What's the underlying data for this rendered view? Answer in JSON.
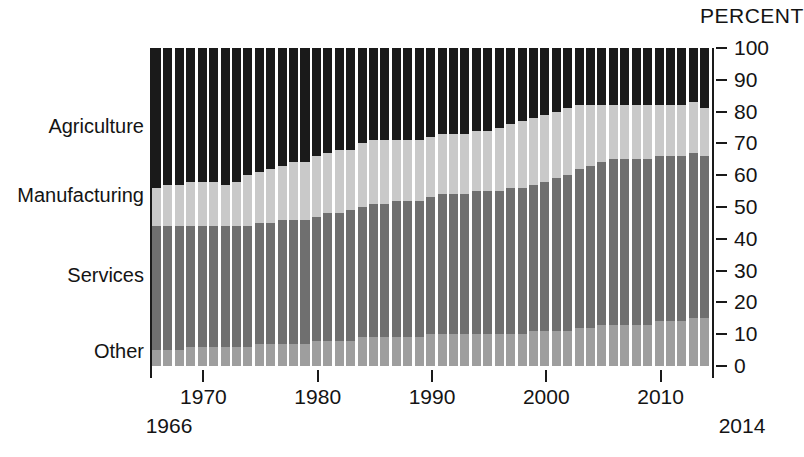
{
  "chart_data": {
    "type": "bar",
    "subtype": "stacked-100-percent",
    "title": "",
    "axis_header": "PERCENT",
    "xlabel": "",
    "ylabel": "PERCENT",
    "ylim": [
      0,
      100
    ],
    "yticks": [
      0,
      10,
      20,
      30,
      40,
      50,
      60,
      70,
      80,
      90,
      100
    ],
    "grid": false,
    "legend_position": "left-inline-labels",
    "x_axis_endpoints": [
      "1966",
      "2014"
    ],
    "xticks": [
      1970,
      1980,
      1990,
      2000,
      2010
    ],
    "xtick_labels": [
      "1970",
      "1980",
      "1990",
      "2000",
      "2010"
    ],
    "categories": [
      1966,
      1967,
      1968,
      1969,
      1970,
      1971,
      1972,
      1973,
      1974,
      1975,
      1976,
      1977,
      1978,
      1979,
      1980,
      1981,
      1982,
      1983,
      1984,
      1985,
      1986,
      1987,
      1988,
      1989,
      1990,
      1991,
      1992,
      1993,
      1994,
      1995,
      1996,
      1997,
      1998,
      1999,
      2000,
      2001,
      2002,
      2003,
      2004,
      2005,
      2006,
      2007,
      2008,
      2009,
      2010,
      2011,
      2012,
      2013,
      2014
    ],
    "series": [
      {
        "name": "Other",
        "color": "#9e9e9e",
        "order": 0,
        "values": [
          5,
          5,
          5,
          6,
          6,
          6,
          6,
          6,
          6,
          7,
          7,
          7,
          7,
          7,
          8,
          8,
          8,
          8,
          9,
          9,
          9,
          9,
          9,
          9,
          10,
          10,
          10,
          10,
          10,
          10,
          10,
          10,
          10,
          11,
          11,
          11,
          11,
          12,
          12,
          13,
          13,
          13,
          13,
          13,
          14,
          14,
          14,
          15,
          15
        ]
      },
      {
        "name": "Services",
        "color": "#6f6f6f",
        "order": 1,
        "values": [
          39,
          39,
          39,
          38,
          38,
          38,
          38,
          38,
          38,
          38,
          38,
          39,
          39,
          39,
          39,
          40,
          40,
          41,
          41,
          42,
          42,
          43,
          43,
          43,
          43,
          44,
          44,
          44,
          45,
          45,
          45,
          46,
          46,
          46,
          47,
          48,
          49,
          50,
          51,
          51,
          52,
          52,
          52,
          52,
          52,
          52,
          52,
          52,
          51
        ]
      },
      {
        "name": "Manufacturing",
        "color": "#c9c9c9",
        "order": 2,
        "values": [
          12,
          13,
          13,
          14,
          14,
          14,
          13,
          14,
          16,
          16,
          17,
          17,
          18,
          18,
          19,
          19,
          20,
          19,
          20,
          20,
          20,
          19,
          19,
          19,
          19,
          19,
          19,
          19,
          19,
          19,
          20,
          20,
          21,
          21,
          21,
          21,
          21,
          20,
          19,
          18,
          17,
          17,
          17,
          17,
          16,
          16,
          16,
          16,
          15
        ]
      },
      {
        "name": "Agriculture",
        "color": "#1a1a1a",
        "order": 3,
        "values": [
          44,
          43,
          43,
          42,
          42,
          42,
          43,
          42,
          40,
          39,
          38,
          37,
          36,
          36,
          34,
          33,
          32,
          32,
          30,
          29,
          29,
          29,
          29,
          29,
          28,
          27,
          27,
          27,
          26,
          26,
          25,
          24,
          23,
          22,
          21,
          20,
          19,
          18,
          18,
          18,
          18,
          18,
          18,
          18,
          18,
          18,
          18,
          17,
          19
        ]
      }
    ],
    "category_labels": [
      {
        "name": "Agriculture",
        "color": "#1a1a1a",
        "y_percent_center": 75
      },
      {
        "name": "Manufacturing",
        "color": "#c9c9c9",
        "y_percent_center": 53
      },
      {
        "name": "Services",
        "color": "#6f6f6f",
        "y_percent_center": 28
      },
      {
        "name": "Other",
        "color": "#9e9e9e",
        "y_percent_center": 4
      }
    ]
  }
}
